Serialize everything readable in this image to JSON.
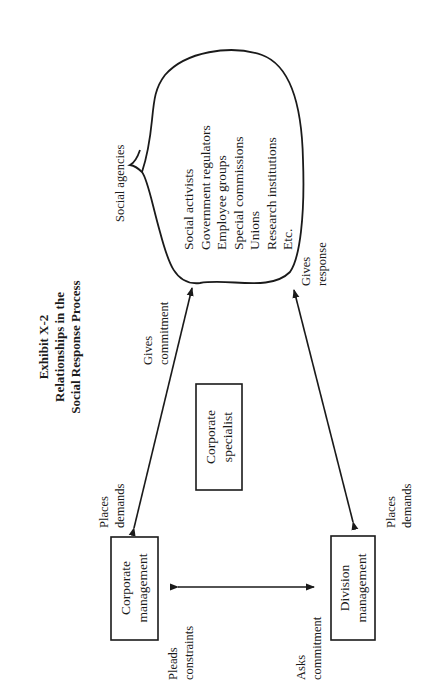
{
  "title": {
    "line1": "Exhibit X-2",
    "line2": "Relationships in the",
    "line3": "Social Response Process"
  },
  "nodes": {
    "social_agencies": {
      "label": "Social agencies",
      "members": [
        "Social activists",
        "Government regulators",
        "Employee groups",
        "Special commissions",
        "Unions",
        "Research institutions",
        "Etc."
      ]
    },
    "corporate_management": {
      "line1": "Corporate",
      "line2": "management"
    },
    "division_management": {
      "line1": "Division",
      "line2": "management"
    },
    "corporate_specialist": {
      "line1": "Corporate",
      "line2": "specialist"
    }
  },
  "edges": {
    "corp_to_agencies": {
      "near_agencies": {
        "line1": "Gives",
        "line2": "commitment"
      },
      "near_corp": {
        "line1": "Places",
        "line2": "demands"
      }
    },
    "div_to_agencies": {
      "near_agencies": {
        "line1": "Gives",
        "line2": "response"
      },
      "near_div": {
        "line1": "Places",
        "line2": "demands"
      }
    },
    "corp_to_div": {
      "near_corp": {
        "line1": "Pleads",
        "line2": "constraints"
      },
      "near_div": {
        "line1": "Asks",
        "line2": "commitment"
      }
    }
  },
  "colors": {
    "ink": "#1a1a1a",
    "background": "#ffffff"
  }
}
